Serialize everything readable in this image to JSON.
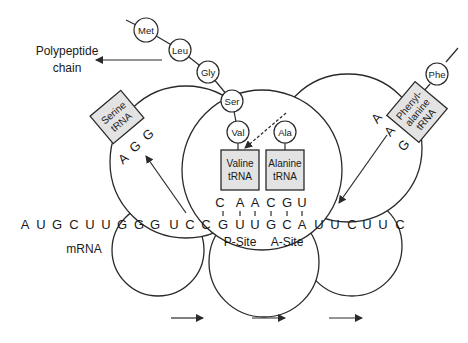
{
  "labels": {
    "polypeptide_line1": "Polypeptide",
    "polypeptide_line2": "chain",
    "mrna": "mRNA",
    "p_site": "P-Site",
    "a_site": "A-Site"
  },
  "amino_acids": {
    "met": "Met",
    "leu": "Leu",
    "gly": "Gly",
    "ser": "Ser",
    "val": "Val",
    "ala": "Ala",
    "phe": "Phe"
  },
  "trnas": {
    "serine": {
      "line1": "Serine",
      "line2": "tRNA",
      "anticodon": [
        "A",
        "G",
        "G"
      ]
    },
    "valine": {
      "line1": "Valine",
      "line2": "tRNA",
      "anticodon": [
        "C",
        "A",
        "A"
      ]
    },
    "alanine": {
      "line1": "Alanine",
      "line2": "tRNA",
      "anticodon": [
        "C",
        "G",
        "U"
      ]
    },
    "phenylalanine": {
      "line1": "Phenyl-",
      "line2": "alanine",
      "line3": "tRNA",
      "anticodon": [
        "A",
        "A",
        "G"
      ]
    }
  },
  "mrna_sequence": [
    "A",
    "U",
    "G",
    "C",
    "U",
    "U",
    "G",
    "G",
    "G",
    "U",
    "C",
    "C",
    "G",
    "U",
    "U",
    "G",
    "C",
    "A",
    "U",
    "U",
    "C",
    "U",
    "U",
    "C"
  ],
  "direction_arrows": 3,
  "colors": {
    "trna_fill": "#e3e3e3",
    "stroke": "#2a2a2a",
    "background": "#ffffff"
  }
}
